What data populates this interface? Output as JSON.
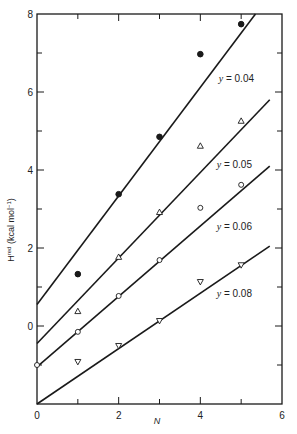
{
  "chart_data": {
    "type": "scatter",
    "title": "",
    "xlabel": "N",
    "ylabel": "H^red (kcal mol^-1)",
    "xlim": [
      0,
      6
    ],
    "ylim": [
      -2,
      8
    ],
    "x_ticks": [
      0,
      2,
      4,
      6
    ],
    "x_minor_ticks": [
      1,
      3,
      5
    ],
    "y_ticks": [
      0,
      2,
      4,
      6,
      8
    ],
    "y_minor_ticks": [
      -1,
      1,
      3,
      5,
      7
    ],
    "y_tick_labels_shown": [
      "0",
      "2",
      "4",
      "6",
      "8"
    ],
    "grid": false,
    "legend": "inline labels next to fitted lines",
    "series": [
      {
        "name": "y = 0.04",
        "marker": "filled-circle",
        "x": [
          1,
          2,
          3,
          4,
          5
        ],
        "values": [
          1.33,
          3.38,
          4.85,
          6.97,
          7.74
        ],
        "fit_line": {
          "x0": 0,
          "y0": 0.55,
          "x1": 5.35,
          "y1": 8.0
        },
        "label_pos": {
          "x": 4.45,
          "y": 6.25
        }
      },
      {
        "name": "y = 0.05",
        "marker": "open-triangle-up",
        "x": [
          1,
          2,
          3,
          4,
          5
        ],
        "values": [
          0.38,
          1.77,
          2.92,
          4.62,
          5.26
        ],
        "fit_line": {
          "x0": 0,
          "y0": -0.45,
          "x1": 5.7,
          "y1": 5.8
        },
        "label_pos": {
          "x": 4.4,
          "y": 4.05
        }
      },
      {
        "name": "y = 0.06",
        "marker": "open-circle",
        "x": [
          0,
          1,
          2,
          3,
          4,
          5
        ],
        "values": [
          -1.0,
          -0.15,
          0.77,
          1.69,
          3.03,
          3.62
        ],
        "fit_line": {
          "x0": 0,
          "y0": -1.05,
          "x1": 5.7,
          "y1": 4.1
        },
        "label_pos": {
          "x": 4.4,
          "y": 2.45
        }
      },
      {
        "name": "y = 0.08",
        "marker": "open-triangle-down",
        "x": [
          1,
          2,
          3,
          4,
          5
        ],
        "values": [
          -0.92,
          -0.51,
          0.13,
          1.13,
          1.56
        ],
        "fit_line": {
          "x0": 0,
          "y0": -2.0,
          "x1": 5.7,
          "y1": 2.05
        },
        "label_pos": {
          "x": 4.4,
          "y": 0.75
        }
      }
    ]
  },
  "labels": {
    "xlabel": "N",
    "ylabel_main": "H",
    "ylabel_sup": "red",
    "ylabel_unit": " (kcal mol",
    "ylabel_unit_sup": "−1",
    "ylabel_close": ")"
  },
  "colors": {
    "ink": "#1a1a1a",
    "background": "#ffffff"
  }
}
